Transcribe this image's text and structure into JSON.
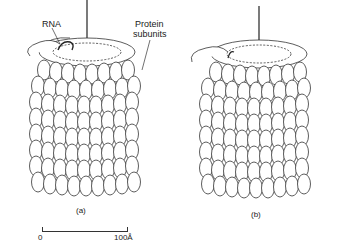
{
  "figure": {
    "panels": [
      {
        "id": "a",
        "caption": "(a)"
      },
      {
        "id": "b",
        "caption": "(b)"
      }
    ],
    "labels": {
      "rna": "RNA",
      "protein_line1": "Protein",
      "protein_line2": "subunits"
    },
    "scale_bar": {
      "start": "0",
      "end": "100Å"
    },
    "colors": {
      "line": "#333333",
      "background": "#ffffff"
    }
  }
}
